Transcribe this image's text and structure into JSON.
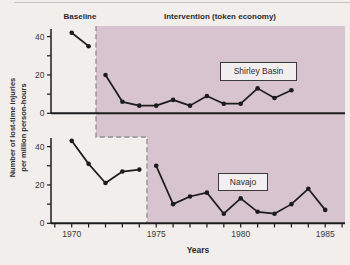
{
  "figure": {
    "phase_label_baseline": "Baseline",
    "phase_label_intervention": "Intervention (token economy)",
    "y_axis_label_line1": "Number of lost-time injuries",
    "y_axis_label_line2": "per million person-hours",
    "x_axis_label": "Years"
  },
  "colors": {
    "background": "#f1eeeb",
    "shaded_region": "#d8c4ce",
    "data_line": "#1c1c1c",
    "axis_line": "#1c1c1c",
    "dashed_boundary": "#8f8f8f",
    "tick_text": "#3a3a3a"
  },
  "x_axis": {
    "label": "Years",
    "tick_start_year": 1969,
    "tick_end_year": 1986,
    "labeled_tick_years": [
      1970,
      1975,
      1980,
      1985
    ]
  },
  "y_axis": {
    "ticks": [
      0,
      10,
      20,
      30,
      40
    ],
    "labeled_ticks": [
      0,
      20,
      40
    ]
  },
  "chart_data": [
    {
      "type": "line",
      "panel": "top",
      "series_label": "Shirley Basin",
      "ylim": [
        0,
        44
      ],
      "phases": [
        {
          "phase": "Baseline",
          "years": [
            1970,
            1971
          ],
          "values": [
            42,
            35
          ]
        },
        {
          "phase": "Intervention (token economy)",
          "years": [
            1972,
            1973,
            1974,
            1975,
            1976,
            1977,
            1978,
            1979,
            1980,
            1981,
            1982,
            1983
          ],
          "values": [
            20,
            6,
            4,
            4,
            7,
            4,
            9,
            5,
            5,
            13,
            8,
            12
          ]
        }
      ]
    },
    {
      "type": "line",
      "panel": "bottom",
      "series_label": "Navajo",
      "ylim": [
        0,
        44
      ],
      "phases": [
        {
          "phase": "Baseline",
          "years": [
            1970,
            1971,
            1972,
            1973,
            1974
          ],
          "values": [
            43,
            31,
            21,
            27,
            28
          ]
        },
        {
          "phase": "Intervention (token economy)",
          "years": [
            1975,
            1976,
            1977,
            1978,
            1979,
            1980,
            1981,
            1982,
            1983,
            1984,
            1985
          ],
          "values": [
            30,
            10,
            14,
            16,
            5,
            13,
            6,
            5,
            10,
            18,
            7
          ]
        }
      ]
    }
  ]
}
